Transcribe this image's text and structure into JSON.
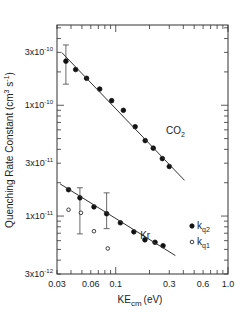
{
  "chart_data": {
    "type": "scatter",
    "title": "",
    "xlabel": "KE_cm (eV)",
    "xlabel_main": "KE",
    "xlabel_sub": "cm",
    "xlabel_unit": "(eV)",
    "ylabel": "Quenching Rate Constant (cm^3 s^-1)",
    "ylabel_main": "Quenching Rate Constant (cm",
    "ylabel_sup1": "3",
    "ylabel_mid": " s",
    "ylabel_sup2": "-1",
    "ylabel_end": ")",
    "x_scale": "log",
    "y_scale": "log",
    "xlim": [
      0.03,
      1.0
    ],
    "ylim": [
      3e-12,
      5.3e-10
    ],
    "x_ticks": [
      {
        "value": 0.03,
        "label": "0.03"
      },
      {
        "value": 0.06,
        "label": "0.06"
      },
      {
        "value": 0.1,
        "label": "0.1"
      },
      {
        "value": 0.3,
        "label": "0.3"
      },
      {
        "value": 0.6,
        "label": "0.6"
      },
      {
        "value": 1.0,
        "label": "1.0"
      }
    ],
    "y_ticks": [
      {
        "value": 3e-10,
        "mant": "3x10",
        "exp": "-10"
      },
      {
        "value": 1e-10,
        "mant": "1x10",
        "exp": "-10"
      },
      {
        "value": 3e-11,
        "mant": "3x10",
        "exp": "-11"
      },
      {
        "value": 1e-11,
        "mant": "1x10",
        "exp": "-11"
      },
      {
        "value": 3e-12,
        "mant": "3x10",
        "exp": "-12"
      }
    ],
    "grid": false,
    "annotations": [
      {
        "text": "CO",
        "sub": "2",
        "x": 0.28,
        "y": 5.5e-11
      },
      {
        "text": "Kr",
        "x": 0.165,
        "y": 6.2e-12
      }
    ],
    "legend": {
      "position": "lower right inside",
      "entries": [
        {
          "marker": "filled-circle",
          "label": "k",
          "sub": "q2"
        },
        {
          "marker": "open-circle",
          "label": "k",
          "sub": "q1"
        }
      ]
    },
    "series": [
      {
        "name": "CO2 k_q2",
        "marker": "filled-circle",
        "x": [
          0.036,
          0.044,
          0.055,
          0.072,
          0.092,
          0.117,
          0.149,
          0.183,
          0.216,
          0.26,
          0.3
        ],
        "y": [
          2.5e-10,
          2.1e-10,
          1.75e-10,
          1.4e-10,
          1.1e-10,
          9e-11,
          6.4e-11,
          4.8e-11,
          4.1e-11,
          3.3e-11,
          2.8e-11
        ],
        "error_bars": [
          {
            "x": 0.036,
            "low": 1.55e-10,
            "high": 3.5e-10
          }
        ]
      },
      {
        "name": "CO2 fit",
        "type": "line",
        "x": [
          0.033,
          0.41
        ],
        "y": [
          3e-10,
          2.1e-11
        ]
      },
      {
        "name": "Kr k_q2",
        "marker": "filled-circle",
        "x": [
          0.038,
          0.048,
          0.064,
          0.083,
          0.11,
          0.145,
          0.182,
          0.224,
          0.264
        ],
        "y": [
          1.73e-11,
          1.46e-11,
          1.21e-11,
          1.05e-11,
          8.7e-12,
          7.2e-12,
          6.1e-12,
          5.8e-12,
          5.4e-12
        ],
        "error_bars": [
          {
            "x": 0.048,
            "low": 6.9e-12,
            "high": 1.8e-11
          },
          {
            "x": 0.083,
            "low": 7.7e-12,
            "high": 1.62e-11
          }
        ]
      },
      {
        "name": "Kr fit",
        "type": "line",
        "x": [
          0.032,
          0.34
        ],
        "y": [
          1.95e-11,
          4.4e-12
        ]
      },
      {
        "name": "Kr k_q1",
        "marker": "open-circle",
        "x": [
          0.038,
          0.049,
          0.064,
          0.085
        ],
        "y": [
          1.14e-11,
          1.07e-11,
          7.3e-12,
          5.1e-12
        ]
      }
    ]
  }
}
